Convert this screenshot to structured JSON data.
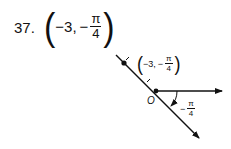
{
  "problem": {
    "number": "37.",
    "point": {
      "r": "−3,",
      "theta_sign": "−",
      "theta_num": "π",
      "theta_den": "4"
    }
  },
  "diagram": {
    "point_label": {
      "r": "−3,",
      "theta_sign": "−",
      "theta_num": "π",
      "theta_den": "4"
    },
    "origin_label": "O",
    "angle_label": {
      "sign": "−",
      "num": "π",
      "den": "4"
    }
  }
}
